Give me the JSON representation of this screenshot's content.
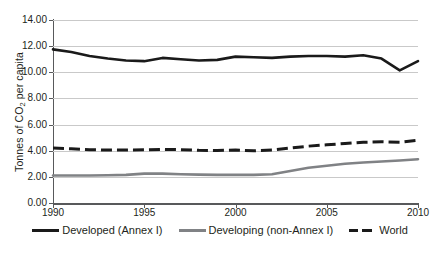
{
  "chart_data": {
    "type": "line",
    "title": "",
    "xlabel": "",
    "ylabel": "Tonnes of CO2 per capita",
    "ylabel_prefix": "Tonnes of CO",
    "ylabel_sub": "2",
    "ylabel_suffix": " per capita",
    "grid": true,
    "legend_position": "bottom",
    "xlim": [
      1990,
      2010
    ],
    "ylim": [
      0,
      14
    ],
    "x": [
      1990,
      1991,
      1992,
      1993,
      1994,
      1995,
      1996,
      1997,
      1998,
      1999,
      2000,
      2001,
      2002,
      2003,
      2004,
      2005,
      2006,
      2007,
      2008,
      2009,
      2010
    ],
    "xtick_labels": [
      "1990",
      "1995",
      "2000",
      "2005",
      "2010"
    ],
    "xtick_values": [
      1990,
      1995,
      2000,
      2005,
      2010
    ],
    "ytick_labels": [
      "0.00",
      "2.00",
      "4.00",
      "6.00",
      "8.00",
      "10.00",
      "12.00",
      "14.00"
    ],
    "ytick_values": [
      0,
      2,
      4,
      6,
      8,
      10,
      12,
      14
    ],
    "series": [
      {
        "name": "Developed (Annex I)",
        "style": "solid",
        "color": "#1a1a1a",
        "values": [
          11.75,
          11.55,
          11.25,
          11.05,
          10.9,
          10.85,
          11.1,
          11.0,
          10.9,
          10.95,
          11.2,
          11.15,
          11.1,
          11.2,
          11.25,
          11.25,
          11.2,
          11.3,
          11.05,
          10.15,
          10.85
        ]
      },
      {
        "name": "Developing (non-Annex I)",
        "style": "solid",
        "color": "#808285",
        "values": [
          2.1,
          2.1,
          2.1,
          2.12,
          2.15,
          2.25,
          2.25,
          2.2,
          2.17,
          2.15,
          2.15,
          2.15,
          2.2,
          2.45,
          2.7,
          2.85,
          3.0,
          3.1,
          3.18,
          3.25,
          3.35
        ]
      },
      {
        "name": "World",
        "style": "dashed",
        "color": "#1a1a1a",
        "values": [
          4.2,
          4.15,
          4.08,
          4.05,
          4.05,
          4.07,
          4.1,
          4.08,
          4.03,
          4.02,
          4.05,
          4.0,
          4.05,
          4.2,
          4.35,
          4.45,
          4.55,
          4.65,
          4.68,
          4.65,
          4.8
        ]
      }
    ]
  },
  "legend": {
    "items": [
      {
        "label": "Developed (Annex I)",
        "swatch": "solid-dark"
      },
      {
        "label": "Developing (non-Annex I)",
        "swatch": "solid-gray"
      },
      {
        "label": "World",
        "swatch": "dashed-dark"
      }
    ]
  }
}
